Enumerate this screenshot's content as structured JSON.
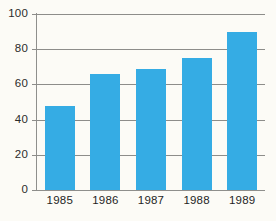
{
  "chart_data": {
    "type": "bar",
    "title": "",
    "subtitle": "",
    "xlabel": "",
    "ylabel": "",
    "categories": [
      "1985",
      "1986",
      "1987",
      "1988",
      "1989"
    ],
    "values": [
      48,
      66,
      69,
      75,
      90
    ],
    "series": [
      {
        "name": "",
        "values": [
          48,
          66,
          69,
          75,
          90
        ]
      }
    ],
    "ylim": [
      0,
      100
    ],
    "yticks": [
      0,
      20,
      40,
      60,
      80,
      100
    ],
    "ytick_labels": [
      "0",
      "20",
      "40",
      "60",
      "80",
      "100"
    ],
    "grid": true,
    "grid_axis": "y",
    "legend": false,
    "legend_position": "none",
    "bar_color": "#35ace4",
    "axis_color": "#8d8d8a",
    "background_color": "#fcfbf6",
    "text_color": "#1f1f1f",
    "annotations": []
  }
}
